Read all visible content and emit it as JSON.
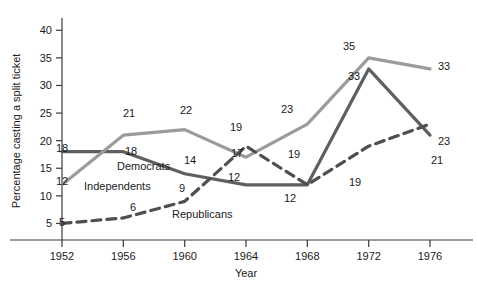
{
  "chart_data": {
    "type": "line",
    "title": "",
    "xlabel": "Year",
    "ylabel": "Percentage casting a split ticket",
    "x": [
      1952,
      1956,
      1960,
      1964,
      1968,
      1972,
      1976
    ],
    "categories": [
      "1952",
      "1956",
      "1960",
      "1964",
      "1968",
      "1972",
      "1976"
    ],
    "xlim": [
      1952,
      1976
    ],
    "ylim": [
      0,
      41
    ],
    "yticks": [
      5,
      10,
      15,
      20,
      25,
      30,
      35,
      40
    ],
    "ytick_labels": [
      "5",
      "10",
      "15",
      "20",
      "25",
      "30",
      "35",
      "40"
    ],
    "grid": false,
    "legend_position": "inline-annotations",
    "series": [
      {
        "name": "Democrats",
        "style": "solid",
        "color": "#5f5f5f",
        "values": [
          18,
          18,
          14,
          12,
          12,
          33,
          21
        ],
        "point_labels": [
          "18",
          "18",
          "14",
          "12",
          "12",
          "33",
          "21"
        ]
      },
      {
        "name": "Independents",
        "style": "solid",
        "color": "#9b9b9b",
        "values": [
          12,
          21,
          22,
          17,
          23,
          35,
          33
        ],
        "point_labels": [
          "12",
          "21",
          "22",
          "17",
          "23",
          "35",
          "33"
        ]
      },
      {
        "name": "Republicans",
        "style": "dashed",
        "color": "#4f4f4f",
        "values": [
          5,
          6,
          9,
          19,
          12,
          19,
          23
        ],
        "point_labels": [
          "5",
          "6",
          "9",
          "19",
          "12",
          "19",
          "23"
        ]
      }
    ],
    "annotations": [
      {
        "text": "Democrats",
        "x": 117,
        "y": 170
      },
      {
        "text": "Independents",
        "x": 84,
        "y": 190
      },
      {
        "text": "Republicans",
        "x": 172,
        "y": 218
      }
    ],
    "value_labels": [
      {
        "text": "18",
        "x": 62,
        "y": 152,
        "series": "Democrats"
      },
      {
        "text": "12",
        "x": 62,
        "y": 185,
        "series": "Independents"
      },
      {
        "text": "5",
        "x": 62,
        "y": 226,
        "series": "Republicans"
      },
      {
        "text": "21",
        "x": 129,
        "y": 117,
        "series": "Independents"
      },
      {
        "text": "18",
        "x": 131,
        "y": 155,
        "series": "Democrats"
      },
      {
        "text": "6",
        "x": 133,
        "y": 211,
        "series": "Republicans"
      },
      {
        "text": "22",
        "x": 186,
        "y": 114,
        "series": "Independents"
      },
      {
        "text": "14",
        "x": 190,
        "y": 164,
        "series": "Democrats"
      },
      {
        "text": "9",
        "x": 182,
        "y": 192,
        "series": "Republicans"
      },
      {
        "text": "19",
        "x": 236,
        "y": 131,
        "series": "Republicans"
      },
      {
        "text": "17",
        "x": 237,
        "y": 157,
        "series": "Independents"
      },
      {
        "text": "12",
        "x": 234,
        "y": 181,
        "series": "Democrats"
      },
      {
        "text": "23",
        "x": 287,
        "y": 113,
        "series": "Independents"
      },
      {
        "text": "19",
        "x": 294,
        "y": 158,
        "series": "Democrats"
      },
      {
        "text": "12",
        "x": 290,
        "y": 202,
        "series": "Republicans"
      },
      {
        "text": "35",
        "x": 349,
        "y": 50,
        "series": "Independents"
      },
      {
        "text": "33",
        "x": 354,
        "y": 80,
        "series": "Democrats"
      },
      {
        "text": "19",
        "x": 355,
        "y": 186,
        "series": "Republicans"
      },
      {
        "text": "33",
        "x": 444,
        "y": 70,
        "series": "Independents"
      },
      {
        "text": "23",
        "x": 444,
        "y": 145,
        "series": "Republicans"
      },
      {
        "text": "21",
        "x": 437,
        "y": 164,
        "series": "Democrats"
      }
    ]
  }
}
